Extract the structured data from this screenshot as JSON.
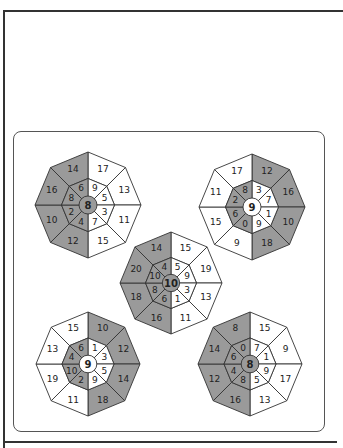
{
  "colors": {
    "shade": "#9a9a9a",
    "light": "#ffffff",
    "line": "#333333"
  },
  "puzzles": [
    {
      "id": "top-left",
      "cx": 88,
      "cy": 205,
      "r": 53,
      "center": "8",
      "outer": [
        "17",
        "13",
        "11",
        "15",
        "12",
        "10",
        "16",
        "14"
      ],
      "inner": [
        "9",
        "5",
        "3",
        "7",
        "4",
        "2",
        "8",
        "6"
      ],
      "shaded": [
        false,
        false,
        false,
        false,
        true,
        true,
        true,
        true
      ],
      "center_shaded": true
    },
    {
      "id": "top-right",
      "cx": 252,
      "cy": 207,
      "r": 53,
      "center": "9",
      "outer": [
        "12",
        "16",
        "10",
        "18",
        "9",
        "15",
        "11",
        "17"
      ],
      "inner": [
        "3",
        "7",
        "1",
        "9",
        "0",
        "6",
        "2",
        "8"
      ],
      "shaded": [
        true,
        true,
        true,
        true,
        false,
        false,
        false,
        false
      ],
      "inner_shaded": [
        false,
        false,
        false,
        false,
        true,
        true,
        true,
        true
      ],
      "center_shaded": false
    },
    {
      "id": "center",
      "cx": 171,
      "cy": 283,
      "r": 51,
      "center": "10",
      "outer": [
        "15",
        "19",
        "13",
        "11",
        "16",
        "18",
        "20",
        "14"
      ],
      "inner": [
        "5",
        "9",
        "3",
        "1",
        "6",
        "8",
        "10",
        "4"
      ],
      "shaded": [
        false,
        false,
        false,
        false,
        true,
        true,
        true,
        true
      ],
      "center_shaded": true
    },
    {
      "id": "bottom-left",
      "cx": 88,
      "cy": 364,
      "r": 52,
      "center": "9",
      "outer": [
        "10",
        "12",
        "14",
        "18",
        "11",
        "19",
        "13",
        "15"
      ],
      "inner": [
        "1",
        "3",
        "5",
        "9",
        "2",
        "10",
        "4",
        "6"
      ],
      "shaded": [
        true,
        true,
        true,
        true,
        false,
        false,
        false,
        false
      ],
      "inner_shaded": [
        false,
        false,
        false,
        false,
        true,
        true,
        true,
        true
      ],
      "center_shaded": false
    },
    {
      "id": "bottom-right",
      "cx": 250,
      "cy": 364,
      "r": 52,
      "center": "8",
      "outer": [
        "15",
        "9",
        "17",
        "13",
        "16",
        "12",
        "14",
        "8"
      ],
      "inner": [
        "7",
        "1",
        "9",
        "5",
        "8",
        "4",
        "6",
        "0"
      ],
      "shaded": [
        false,
        false,
        false,
        false,
        true,
        true,
        true,
        true
      ],
      "center_shaded": true
    }
  ]
}
